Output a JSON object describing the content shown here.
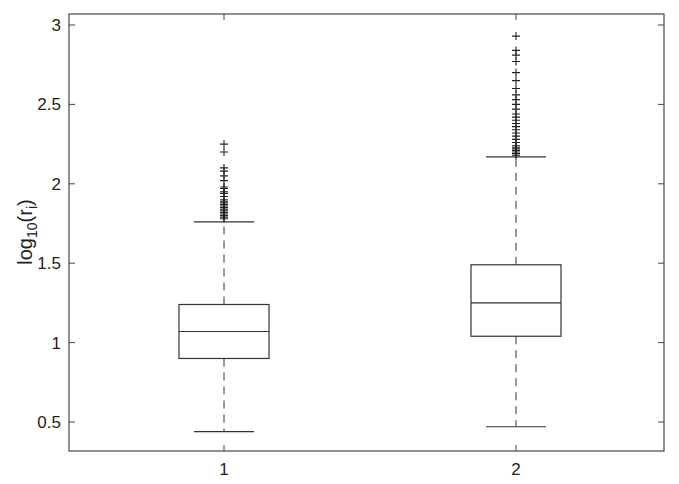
{
  "chart_data": {
    "type": "box",
    "title": "",
    "xlabel": "",
    "ylabel": "log10(r_i)",
    "ylabel_parts": {
      "main": "log",
      "sub": "10",
      "open": "(r",
      "isub": "i",
      "close": ")"
    },
    "categories": [
      "1",
      "2"
    ],
    "ylim": [
      0.3,
      3.07
    ],
    "yticks": [
      0.5,
      1,
      1.5,
      2,
      2.5,
      3
    ],
    "ytick_labels": [
      "0.5",
      "1",
      "1.5",
      "2",
      "2.5",
      "3"
    ],
    "grid": false,
    "legend": null,
    "series": [
      {
        "name": "1",
        "whisker_low": 0.44,
        "q1": 0.9,
        "median": 1.07,
        "q3": 1.24,
        "whisker_high": 1.76,
        "outliers": [
          1.78,
          1.79,
          1.8,
          1.81,
          1.82,
          1.83,
          1.84,
          1.85,
          1.86,
          1.87,
          1.88,
          1.89,
          1.9,
          1.92,
          1.94,
          1.95,
          1.97,
          1.98,
          2.02,
          2.05,
          2.08,
          2.1,
          2.2,
          2.25
        ]
      },
      {
        "name": "2",
        "whisker_low": 0.47,
        "q1": 1.04,
        "median": 1.25,
        "q3": 1.49,
        "whisker_high": 2.17,
        "outliers": [
          2.18,
          2.19,
          2.2,
          2.21,
          2.22,
          2.23,
          2.24,
          2.26,
          2.28,
          2.3,
          2.32,
          2.34,
          2.36,
          2.38,
          2.4,
          2.42,
          2.44,
          2.47,
          2.5,
          2.53,
          2.56,
          2.6,
          2.65,
          2.7,
          2.77,
          2.81,
          2.84,
          2.93
        ]
      }
    ]
  },
  "colors": {
    "line": "#333333",
    "outlier": "#222222",
    "axis": "#444444",
    "background": "#ffffff"
  }
}
